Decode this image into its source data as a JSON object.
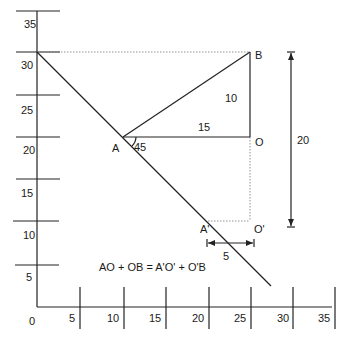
{
  "figure": {
    "type": "geometry-diagram",
    "y_axis": {
      "ticks": [
        {
          "value": 35,
          "label": "35"
        },
        {
          "value": 30,
          "label": "30"
        },
        {
          "value": 25,
          "label": "25"
        },
        {
          "value": 20,
          "label": "20"
        },
        {
          "value": 15,
          "label": "15"
        },
        {
          "value": 10,
          "label": "10"
        },
        {
          "value": 5,
          "label": "5"
        }
      ]
    },
    "x_axis": {
      "ticks": [
        {
          "value": 0,
          "label": "0"
        },
        {
          "value": 5,
          "label": "5"
        },
        {
          "value": 10,
          "label": "10"
        },
        {
          "value": 15,
          "label": "15"
        },
        {
          "value": 20,
          "label": "20"
        },
        {
          "value": 25,
          "label": "25"
        },
        {
          "value": 30,
          "label": "30"
        },
        {
          "value": 35,
          "label": "35"
        }
      ]
    },
    "points": {
      "A": {
        "label": "A",
        "x": 10,
        "y": 20
      },
      "B": {
        "label": "B",
        "x": 25,
        "y": 30
      },
      "O": {
        "label": "O",
        "x": 25,
        "y": 20
      },
      "A_prime": {
        "label": "A'",
        "x": 20,
        "y": 10
      },
      "O_prime": {
        "label": "O'",
        "x": 25,
        "y": 10
      }
    },
    "measurements": {
      "AO": "15",
      "OB": "10",
      "angle_A": "45",
      "vertical_span": "20",
      "horizontal_shift": "5"
    },
    "equation": "AO + OB = A'O' + O'B"
  }
}
